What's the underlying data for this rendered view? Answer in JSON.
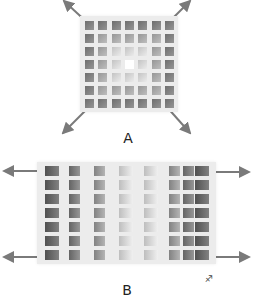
{
  "figure": {
    "panels": [
      {
        "label": "A",
        "description": "Square lattice stretched biaxially along diagonals",
        "grid": {
          "rows": 7,
          "cols": 7
        },
        "arrows": [
          "up-left",
          "up-right",
          "down-left",
          "down-right"
        ]
      },
      {
        "label": "B",
        "description": "Rectangular lattice stretched uniaxially left/right",
        "grid": {
          "rows": 7,
          "cols": 8
        },
        "arrows": [
          "left-top",
          "left-bottom",
          "right-top",
          "right-bottom"
        ]
      }
    ],
    "corner_mark": "♐",
    "colors": {
      "lattice_bg": "#ececec",
      "cell_dark": "#8a8a8a",
      "cell_light": "#ffffff",
      "arrow": "#7a7a7a"
    }
  }
}
